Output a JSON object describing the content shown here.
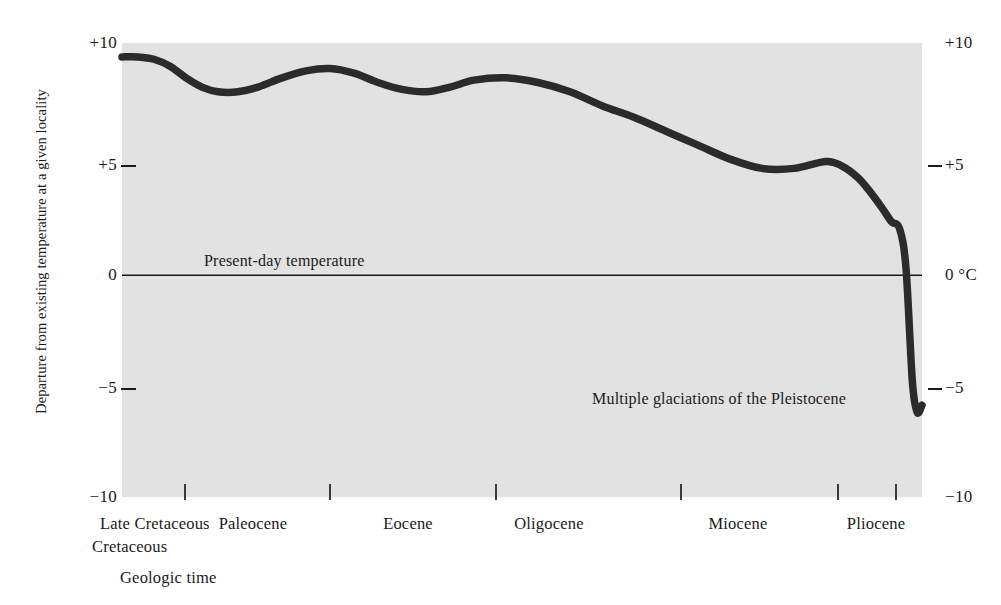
{
  "figure": {
    "background_color": "#ffffff",
    "panel_color": "#e2e2e2",
    "curve_color": "#2b2b2b",
    "axis_color": "#1a1a1a"
  },
  "axes": {
    "y_axis_title": "Departure from existing temperature at a given locality",
    "x_axis_title": "Geologic time",
    "y_left_labels": [
      "+10",
      "+5",
      "0",
      "−5",
      "−10"
    ],
    "y_right_labels": [
      "+10",
      "+5",
      "0 °C",
      "−5",
      "−10"
    ],
    "y_unit": "°C"
  },
  "annotations": {
    "zero_line": "Present-day temperature",
    "glaciation": "Multiple glaciations of the Pleistocene"
  },
  "chart_data": {
    "type": "line",
    "title": "",
    "subtitle": "",
    "xlabel": "Geologic time",
    "ylabel": "Departure from existing temperature at a given locality",
    "ylim": [
      -10,
      10
    ],
    "yticks": [
      -10,
      -5,
      0,
      5,
      10
    ],
    "ytick_labels": [
      "−10",
      "−5",
      "0",
      "+5",
      "+10"
    ],
    "y_unit": "°C",
    "grid": false,
    "legend": "none",
    "x_category_labels": [
      "Late Cretaceous",
      "Paleocene",
      "Eocene",
      "Oligocene",
      "Miocene",
      "Pliocene"
    ],
    "x_tick_positions_px": [
      184,
      329,
      495,
      680,
      837,
      895
    ],
    "zero_reference_line": {
      "value": 0,
      "label": "Present-day temperature"
    },
    "callouts": [
      {
        "label": "Multiple glaciations of the Pleistocene",
        "approx_value": -5.8
      }
    ],
    "series": [
      {
        "name": "Departure from existing temperature",
        "x": [
          0.0,
          2.0,
          4.0,
          6.0,
          8.0,
          10.0,
          12.0,
          14.5,
          17.0,
          20.0,
          23.0,
          26.0,
          29.0,
          32.0,
          35.0,
          38.0,
          41.0,
          44.0,
          48.0,
          52.0,
          56.0,
          60.0,
          64.0,
          68.0,
          72.0,
          76.0,
          80.0,
          84.0,
          88.0,
          90.0,
          92.0,
          93.5,
          95.0,
          96.2,
          97.2,
          98.0,
          98.8,
          99.4,
          100.0
        ],
        "y": [
          9.4,
          9.4,
          9.3,
          9.0,
          8.5,
          8.1,
          7.9,
          7.9,
          8.1,
          8.5,
          8.8,
          8.9,
          8.7,
          8.3,
          8.0,
          7.9,
          8.1,
          8.4,
          8.5,
          8.3,
          7.9,
          7.3,
          6.8,
          6.2,
          5.6,
          5.0,
          4.6,
          4.6,
          4.9,
          4.7,
          4.2,
          3.6,
          2.9,
          2.3,
          2.0,
          0.3,
          -4.6,
          -5.9,
          -5.6
        ]
      }
    ]
  }
}
